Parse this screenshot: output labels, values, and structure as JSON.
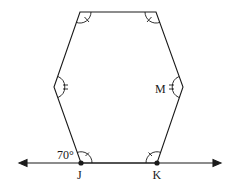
{
  "diagram": {
    "type": "geometry",
    "colors": {
      "stroke": "#1a1a1a",
      "background": "#ffffff"
    },
    "vertices": {
      "top_left": {
        "x": 80,
        "y": 12
      },
      "top_right": {
        "x": 156,
        "y": 12
      },
      "right": {
        "x": 183,
        "y": 87,
        "label": "M"
      },
      "K": {
        "x": 157,
        "y": 163,
        "label": "K"
      },
      "J": {
        "x": 81,
        "y": 163,
        "label": "J"
      },
      "left": {
        "x": 54,
        "y": 87
      }
    },
    "line": {
      "x1": 20,
      "x2": 220,
      "y": 163,
      "arrows": "both"
    },
    "labels": {
      "angle": "70°",
      "J": "J",
      "K": "K",
      "M": "M"
    },
    "angle_markings": {
      "single_tick": [
        "top_left",
        "top_right",
        "J",
        "K"
      ],
      "double_tick": [
        "left",
        "right"
      ]
    }
  }
}
